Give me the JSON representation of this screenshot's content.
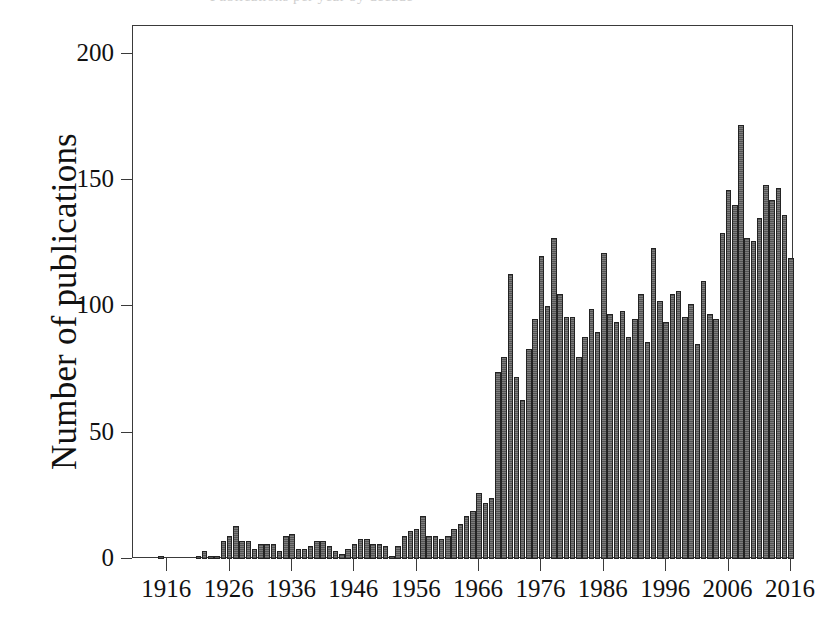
{
  "figure": {
    "top_ghost_caption": "Publications per year by decade",
    "background_color": "#ffffff",
    "frame_color": "#3a3a3a"
  },
  "chart_data": {
    "type": "bar",
    "title": "",
    "xlabel": "",
    "ylabel": "Number of publications",
    "ylim": [
      0,
      211
    ],
    "xlim": [
      1911,
      2017
    ],
    "grid": false,
    "legend": null,
    "bar_color": "#6a6a6a",
    "bar_edge_color": "#232323",
    "y_ticks": [
      0,
      50,
      100,
      150,
      200
    ],
    "y_tick_labels": [
      "0",
      "50",
      "100",
      "150",
      "200"
    ],
    "x_ticks": [
      1916,
      1926,
      1936,
      1946,
      1956,
      1966,
      1976,
      1986,
      1996,
      2006,
      2016
    ],
    "x_tick_labels": [
      "1916",
      "1926",
      "1936",
      "1946",
      "1956",
      "1966",
      "1976",
      "1986",
      "1996",
      "2006",
      "2016"
    ],
    "categories": [
      1912,
      1913,
      1914,
      1915,
      1916,
      1917,
      1918,
      1919,
      1920,
      1921,
      1922,
      1923,
      1924,
      1925,
      1926,
      1927,
      1928,
      1929,
      1930,
      1931,
      1932,
      1933,
      1934,
      1935,
      1936,
      1937,
      1938,
      1939,
      1940,
      1941,
      1942,
      1943,
      1944,
      1945,
      1946,
      1947,
      1948,
      1949,
      1950,
      1951,
      1952,
      1953,
      1954,
      1955,
      1956,
      1957,
      1958,
      1959,
      1960,
      1961,
      1962,
      1963,
      1964,
      1965,
      1966,
      1967,
      1968,
      1969,
      1970,
      1971,
      1972,
      1973,
      1974,
      1975,
      1976,
      1977,
      1978,
      1979,
      1980,
      1981,
      1982,
      1983,
      1984,
      1985,
      1986,
      1987,
      1988,
      1989,
      1990,
      1991,
      1992,
      1993,
      1994,
      1995,
      1996,
      1997,
      1998,
      1999,
      2000,
      2001,
      2002,
      2003,
      2004,
      2005,
      2006,
      2007,
      2008,
      2009,
      2010,
      2011,
      2012,
      2013,
      2014,
      2015,
      2016
    ],
    "values": [
      0,
      0,
      0,
      1,
      0,
      0,
      0,
      0,
      0,
      1,
      3,
      1,
      1,
      7,
      9,
      13,
      7,
      7,
      4,
      6,
      6,
      6,
      3,
      9,
      10,
      4,
      4,
      5,
      7,
      7,
      5,
      3,
      2,
      4,
      6,
      8,
      8,
      6,
      6,
      5,
      1,
      5,
      9,
      11,
      12,
      17,
      9,
      9,
      8,
      9,
      12,
      14,
      17,
      19,
      26,
      22,
      24,
      74,
      80,
      113,
      72,
      63,
      83,
      95,
      120,
      100,
      127,
      105,
      96,
      96,
      80,
      88,
      99,
      90,
      121,
      97,
      94,
      98,
      88,
      95,
      105,
      86,
      123,
      102,
      94,
      105,
      106,
      96,
      101,
      85,
      110,
      97,
      95,
      129,
      146,
      140,
      172,
      127,
      126,
      135,
      148,
      142,
      147,
      136,
      119
    ]
  }
}
